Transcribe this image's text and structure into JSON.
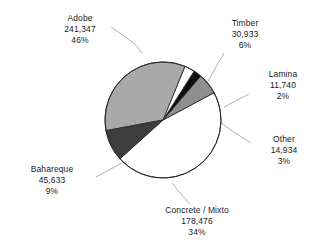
{
  "chart_data": {
    "type": "pie",
    "title": "",
    "subtitle": "",
    "xlabel": "",
    "ylabel": "",
    "legend_position": "none",
    "grid": false,
    "labels_show_value": true,
    "labels_show_percent": true,
    "total": 523063,
    "categories": [
      "Adobe",
      "Timber",
      "Lamina",
      "Other",
      "Concrete / Mixto",
      "Bahareque"
    ],
    "values": [
      241347,
      30933,
      11740,
      14934,
      178476,
      45633
    ],
    "percents": [
      46,
      6,
      2,
      3,
      34,
      9
    ],
    "value_labels": [
      "241,347",
      "30,933",
      "11,740",
      "14,934",
      "178,476",
      "45,633"
    ],
    "percent_labels": [
      "46%",
      "6%",
      "2%",
      "3%",
      "34%",
      "9%"
    ],
    "colors": [
      "#ffffff",
      "#8f8f8f",
      "#0d0d0d",
      "#ffffff",
      "#a9a9a9",
      "#3d3d3d"
    ],
    "slices": [
      {
        "name": "Adobe",
        "value": 241347,
        "value_label": "241,347",
        "percent": 46,
        "percent_label": "46%",
        "color": "#ffffff",
        "start_angle": -42,
        "end_angle": 123.6
      },
      {
        "name": "Timber",
        "value": 30933,
        "value_label": "30,933",
        "percent": 6,
        "percent_label": "6%",
        "color": "#8f8f8f",
        "start_angle": -63.6,
        "end_angle": -42
      },
      {
        "name": "Lamina",
        "value": 11740,
        "value_label": "11,740",
        "percent": 2,
        "percent_label": "2%",
        "color": "#0d0d0d",
        "start_angle": -71.7,
        "end_angle": -63.6
      },
      {
        "name": "Other",
        "value": 14934,
        "value_label": "14,934",
        "percent": 3,
        "percent_label": "3%",
        "color": "#ffffff",
        "start_angle": -82,
        "end_angle": -71.7
      },
      {
        "name": "Concrete / Mixto",
        "value": 178476,
        "value_label": "178,476",
        "percent": 34,
        "percent_label": "34%",
        "color": "#a9a9a9",
        "start_angle": -204.8,
        "end_angle": -82
      },
      {
        "name": "Bahareque",
        "value": 45633,
        "value_label": "45,633",
        "percent": 9,
        "percent_label": "9%",
        "color": "#3d3d3d",
        "start_angle": -237,
        "end_angle": -204.8
      }
    ]
  },
  "labels": {
    "adobe": {
      "name": "Adobe",
      "value": "241,347",
      "percent": "46%"
    },
    "timber": {
      "name": "Timber",
      "value": "30,933",
      "percent": "6%"
    },
    "lamina": {
      "name": "Lamina",
      "value": "11,740",
      "percent": "2%"
    },
    "other": {
      "name": "Other",
      "value": "14,934",
      "percent": "3%"
    },
    "concrete": {
      "name": "Concrete / Mixto",
      "value": "178,476",
      "percent": "34%"
    },
    "bahareque": {
      "name": "Bahareque",
      "value": "45,633",
      "percent": "9%"
    }
  }
}
